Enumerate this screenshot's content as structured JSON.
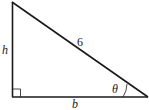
{
  "diagram": {
    "type": "right-triangle",
    "labels": {
      "hypotenuse": "6",
      "height": "h",
      "base": "b",
      "angle": "θ"
    },
    "colors": {
      "stroke": "#1a1a1a",
      "background": "#ffffff"
    }
  }
}
